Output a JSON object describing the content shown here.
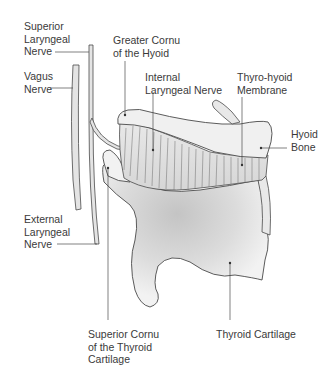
{
  "diagram": {
    "colors": {
      "outline": "#4a4a4a",
      "cartilage_fill": "#f0f0f0",
      "cartilage_shade": "#bdbdbd",
      "membrane_fill": "#e6e6e6",
      "leader_line": "#4a4a4a",
      "text": "#3a3a3a"
    },
    "labels": {
      "superior_laryngeal_nerve": "Superior\nLaryngeal\nNerve",
      "vagus_nerve": "Vagus\nNerve",
      "greater_cornu_hyoid": "Greater Cornu\nof the Hyoid",
      "internal_laryngeal_nerve": "Internal\nLaryngeal Nerve",
      "thyrohyoid_membrane": "Thyro-hyoid\nMembrane",
      "hyoid_bone": "Hyoid\nBone",
      "external_laryngeal_nerve": "External\nLaryngeal\nNerve",
      "superior_cornu_thyroid": "Superior Cornu\nof the Thyroid\nCartilage",
      "thyroid_cartilage": "Thyroid Cartilage"
    }
  }
}
